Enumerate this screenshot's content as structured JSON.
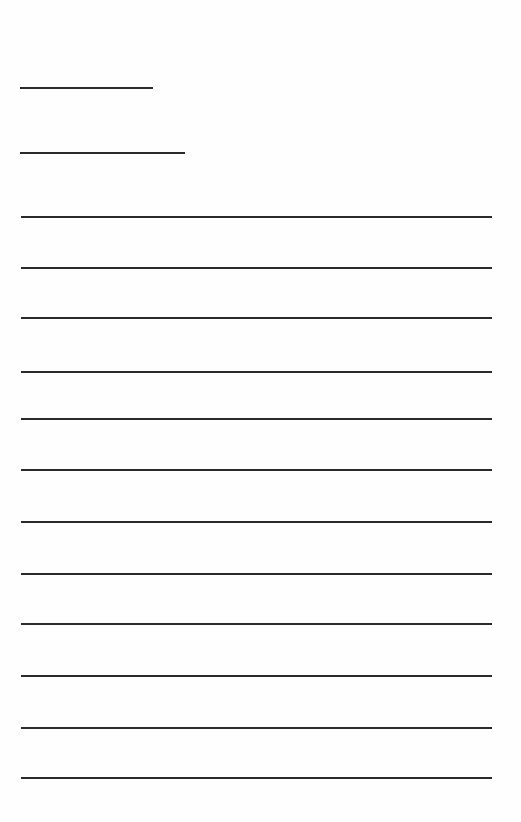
{
  "page": {
    "type": "blank lined form",
    "background": "#fefefe",
    "line_color": "#2a2a2a"
  },
  "header_fields": [
    {
      "label": "",
      "value": "",
      "y": 87,
      "x1": 20,
      "x2": 153
    },
    {
      "label": "",
      "value": "",
      "y": 152,
      "x1": 20,
      "x2": 185
    }
  ],
  "writing_lines": [
    {
      "value": "",
      "y": 216
    },
    {
      "value": "",
      "y": 267
    },
    {
      "value": "",
      "y": 317
    },
    {
      "value": "",
      "y": 371
    },
    {
      "value": "",
      "y": 418
    },
    {
      "value": "",
      "y": 469
    },
    {
      "value": "",
      "y": 521
    },
    {
      "value": "",
      "y": 573
    },
    {
      "value": "",
      "y": 623
    },
    {
      "value": "",
      "y": 675
    },
    {
      "value": "",
      "y": 727
    },
    {
      "value": "",
      "y": 777
    }
  ],
  "writing_line_span": {
    "x1": 21,
    "x2": 492
  }
}
